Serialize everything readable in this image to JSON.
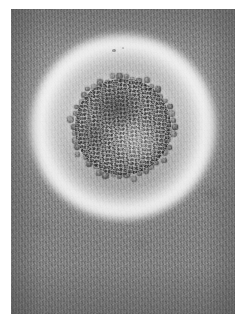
{
  "image": {
    "kind": "electron-micrograph",
    "subject": "coronavirus-virion",
    "modality": "transmission electron microscopy, negative stain",
    "color_mode": "grayscale",
    "caption": "",
    "width_px": 247,
    "height_px": 323
  },
  "frame": {
    "border_color": "#ffffff",
    "border_left_px": 11,
    "border_top_px": 9,
    "content_width_px": 224,
    "content_height_px": 305
  },
  "palette": {
    "background_gray": "#8e8e8e",
    "background_light_gray": "#d9d9d9",
    "halo_white": "#ffffff",
    "envelope_dark": "#3d3d3d",
    "core_mid_gray": "#b0b0b0",
    "core_light_gray": "#d2d2d2",
    "spike_dark": "#4a4a4a"
  },
  "features": [
    {
      "name": "virion-particle",
      "shape": "roughly-circular",
      "center_x_pct": 50,
      "center_y_pct": 38.7,
      "diameter_px": 96,
      "description": "granular mottled nucleocapsid interior"
    },
    {
      "name": "envelope-rim",
      "shape": "ring",
      "diameter_px": 104,
      "description": "dark stained membrane outline"
    },
    {
      "name": "spike-corona",
      "shape": "ring-of-clubs",
      "diameter_px": 110,
      "spike_count": 46,
      "description": "club-shaped surface projections forming a crown"
    },
    {
      "name": "bright-halo",
      "shape": "ring",
      "diameter_px": 186,
      "description": "bright negative-stain exclusion halo around the particle"
    },
    {
      "name": "film-grain-background",
      "shape": "field",
      "description": "grainy mid-gray support film"
    }
  ],
  "annotations": {
    "scale_bar": "",
    "labels": [],
    "magnification": ""
  }
}
